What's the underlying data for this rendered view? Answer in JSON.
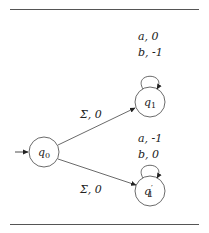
{
  "diagram": {
    "type": "automaton",
    "states": [
      {
        "id": "q0",
        "name": "q",
        "sub": "0",
        "prime": "",
        "initial": true,
        "cx": 44,
        "cy": 152
      },
      {
        "id": "q1",
        "name": "q",
        "sub": "1",
        "prime": "",
        "initial": false,
        "cx": 150,
        "cy": 102
      },
      {
        "id": "q1p",
        "name": "q",
        "sub": "1",
        "prime": "′",
        "initial": false,
        "cx": 150,
        "cy": 191
      }
    ],
    "transitions": [
      {
        "from": "q0",
        "to": "q1",
        "label": "Σ, 0"
      },
      {
        "from": "q0",
        "to": "q1p",
        "label": "Σ, 0"
      },
      {
        "from": "q1",
        "to": "q1",
        "labels": [
          "a, 0",
          "b, -1"
        ]
      },
      {
        "from": "q1p",
        "to": "q1p",
        "labels": [
          "a, -1",
          "b, 0"
        ]
      }
    ]
  },
  "labels": {
    "q1_loop_a": "a",
    "q1_loop_a_val": ", 0",
    "q1_loop_b": "b",
    "q1_loop_b_val": ", -1",
    "q1p_loop_a": "a",
    "q1p_loop_a_val": ", -1",
    "q1p_loop_b": "b",
    "q1p_loop_b_val": ", 0",
    "edge_q0_q1_sym": "Σ",
    "edge_q0_q1_val": ", 0",
    "edge_q0_q1p_sym": "Σ",
    "edge_q0_q1p_val": ", 0",
    "q0_name": "q",
    "q0_sub": "0",
    "q1_name": "q",
    "q1_sub": "1",
    "q1p_name": "q",
    "q1p_prime": "′",
    "q1p_sub": "1"
  }
}
